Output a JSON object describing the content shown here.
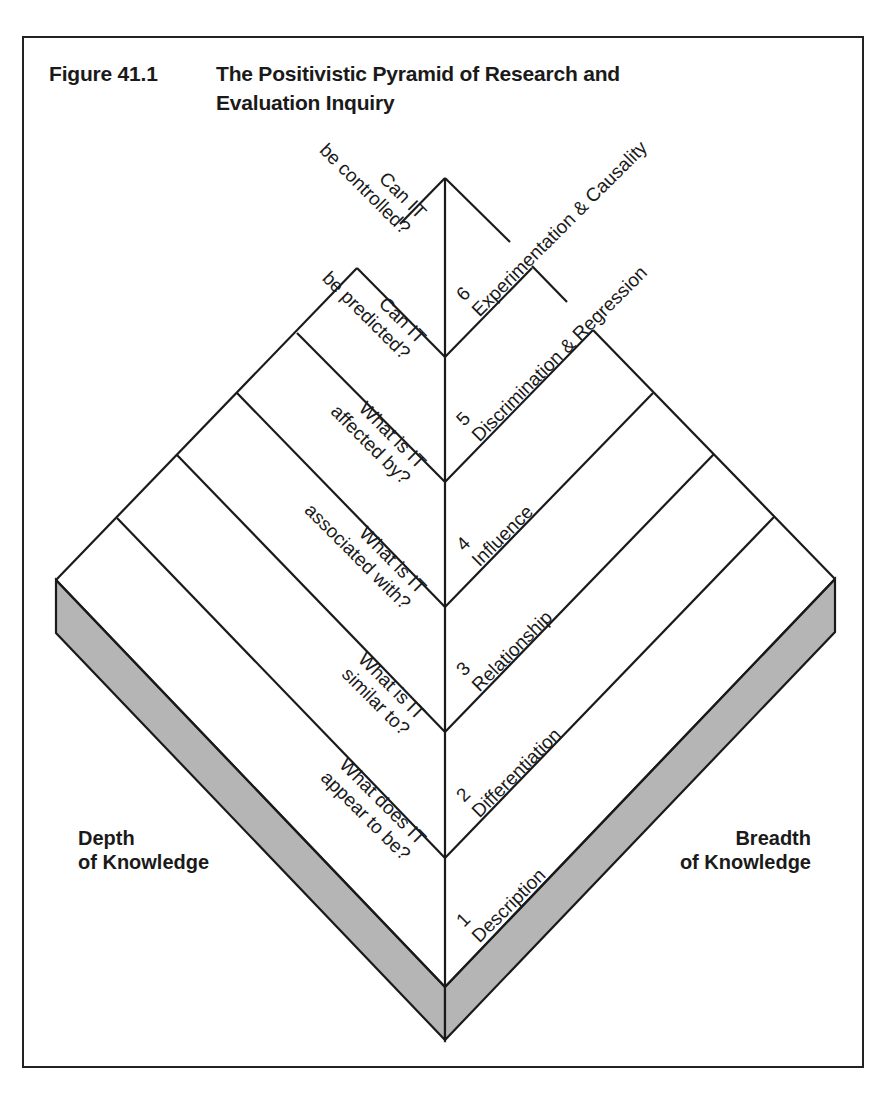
{
  "figure": {
    "number": "Figure 41.1",
    "title_line1": "The Positivistic Pyramid of Research and",
    "title_line2": "Evaluation Inquiry"
  },
  "axes": {
    "left": {
      "line1": "Depth",
      "line2": "of Knowledge"
    },
    "right": {
      "line1": "Breadth",
      "line2": "of Knowledge"
    }
  },
  "levels": [
    {
      "number": "1",
      "name": "Description",
      "question_line1": "What does IT",
      "question_line2": "appear to be?"
    },
    {
      "number": "2",
      "name": "Differentiation",
      "question_line1": "What is IT",
      "question_line2": "similar to?"
    },
    {
      "number": "3",
      "name": "Relationship",
      "question_line1": "What is IT",
      "question_line2": "associated with?"
    },
    {
      "number": "4",
      "name": "Influence",
      "question_line1": "What is IT",
      "question_line2": "affected by?"
    },
    {
      "number": "5",
      "name": "Discrimination & Regression",
      "question_line1": "Can IT",
      "question_line2": "be predicted?"
    },
    {
      "number": "6",
      "name": "Experimentation & Causality",
      "question_line1": "Can IT",
      "question_line2": "be controlled?"
    }
  ],
  "colors": {
    "line": "#1a1a1a",
    "slab": "#b5b5b5",
    "background": "#ffffff"
  }
}
